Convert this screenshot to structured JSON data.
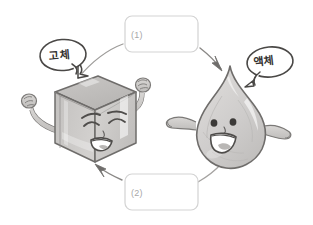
{
  "diagram": {
    "background_color": "#ffffff",
    "ink_color": "#6e6c6a",
    "fill_color": "#cfcdcb",
    "box_border_color": "#d0d0d0",
    "box_text_color": "#a8a8a8"
  },
  "characters": [
    {
      "id": "ice-cube",
      "name": "ice-cube-character",
      "state_label": "고체",
      "bubble_name": "speech-bubble-solid",
      "expression": "grinning-squint",
      "pose": "arms-raised"
    },
    {
      "id": "water-drop",
      "name": "water-drop-character",
      "state_label": "액체",
      "bubble_name": "speech-bubble-liquid",
      "expression": "open-smile",
      "pose": "wavy-arms"
    }
  ],
  "answer_boxes": [
    {
      "id": "box-1",
      "label": "(1)",
      "value": "",
      "placeholder": "",
      "direction": "solid-to-liquid"
    },
    {
      "id": "box-2",
      "label": "(2)",
      "value": "",
      "placeholder": "",
      "direction": "liquid-to-solid"
    }
  ],
  "arrows": [
    {
      "id": "arrow-top",
      "from": "ice-cube",
      "to": "water-drop",
      "label_ref": "(1)"
    },
    {
      "id": "arrow-bottom",
      "from": "water-drop",
      "to": "ice-cube",
      "label_ref": "(2)"
    }
  ],
  "bubbles": {
    "solid": "고체",
    "liquid": "액체"
  }
}
